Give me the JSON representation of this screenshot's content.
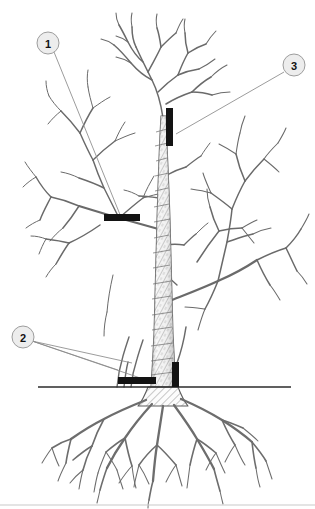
{
  "figure": {
    "type": "line-art-illustration",
    "background_color": "#ffffff",
    "ink_color": "#5d5d5d",
    "marker_color": "#131313",
    "leader_line_color": "#8a8a8a",
    "ground_line_color": "#2b2b2b",
    "footer_rule_color": "#c9c9c9"
  },
  "callouts": [
    {
      "id": "callout-1",
      "label": "1",
      "circle": {
        "cx": 48,
        "cy": 43,
        "r": 11
      },
      "fill": "#ededed",
      "stroke": "#9d9d9d",
      "leaders": [
        {
          "x1": 54,
          "y1": 52,
          "x2": 121,
          "y2": 217
        }
      ],
      "target": "horizontal-cut-bar-on-lower-left-scaffold-branch"
    },
    {
      "id": "callout-2",
      "label": "2",
      "circle": {
        "cx": 23,
        "cy": 337,
        "r": 11
      },
      "fill": "#ededed",
      "stroke": "#9d9d9d",
      "leaders": [
        {
          "x1": 32,
          "y1": 341,
          "x2": 149,
          "y2": 381
        },
        {
          "x1": 32,
          "y1": 341,
          "x2": 130,
          "y2": 364
        },
        {
          "x1": 32,
          "y1": 341,
          "x2": 117,
          "y2": 371
        }
      ],
      "target": "root-suckers-and-horizontal-cut-bar-at-ground-level"
    },
    {
      "id": "callout-3",
      "label": "3",
      "circle": {
        "cx": 294,
        "cy": 65,
        "r": 11
      },
      "fill": "#ededed",
      "stroke": "#9d9d9d",
      "leaders": [
        {
          "x1": 284,
          "y1": 72,
          "x2": 176,
          "y2": 134
        }
      ],
      "target": "vertical-cut-bar-on-central-leader-trunk"
    }
  ],
  "cut_markers": [
    {
      "id": "cut-marker-vertical-trunk",
      "orientation": "vertical",
      "x": 166,
      "y": 108,
      "width": 7,
      "height": 38,
      "related_callout": "3"
    },
    {
      "id": "cut-marker-horizontal-scaffold",
      "orientation": "horizontal",
      "x": 104,
      "y": 214,
      "width": 36,
      "height": 7,
      "related_callout": "1"
    },
    {
      "id": "cut-marker-horizontal-ground",
      "orientation": "horizontal",
      "x": 118,
      "y": 377,
      "width": 38,
      "height": 7,
      "related_callout": "2"
    },
    {
      "id": "cut-marker-vertical-rootflare",
      "orientation": "vertical",
      "x": 172,
      "y": 362,
      "width": 7,
      "height": 25,
      "related_callout": "2"
    }
  ],
  "ground_line": {
    "id": "soil-surface-line",
    "x1": 38,
    "y1": 387,
    "x2": 291,
    "y2": 387,
    "stroke_width": 1.4
  },
  "footer_rule": {
    "id": "page-bottom-rule",
    "x1": 0,
    "y1": 505,
    "x2": 315,
    "y2": 505,
    "stroke_width": 1
  }
}
